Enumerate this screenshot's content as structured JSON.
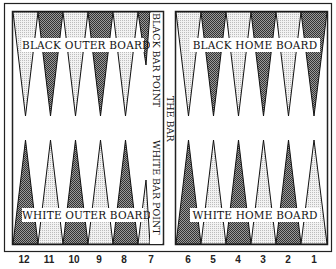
{
  "colors": {
    "dark_point": "#6e6e6e",
    "light_point": "#d9d9d9",
    "frame": "#222222",
    "background": "#ffffff"
  },
  "labels": {
    "black_outer_board": "BLACK OUTER BOARD",
    "black_home_board": "BLACK HOME BOARD",
    "white_outer_board": "WHITE OUTER BOARD",
    "white_home_board": "WHITE HOME BOARD",
    "black_bar_point": "BLACK BAR POINT",
    "white_bar_point": "WHITE BAR POINT",
    "the_bar": "THE BAR"
  },
  "point_numbers": [
    "12",
    "11",
    "10",
    "9",
    "8",
    "7",
    "6",
    "5",
    "4",
    "3",
    "2",
    "1"
  ]
}
